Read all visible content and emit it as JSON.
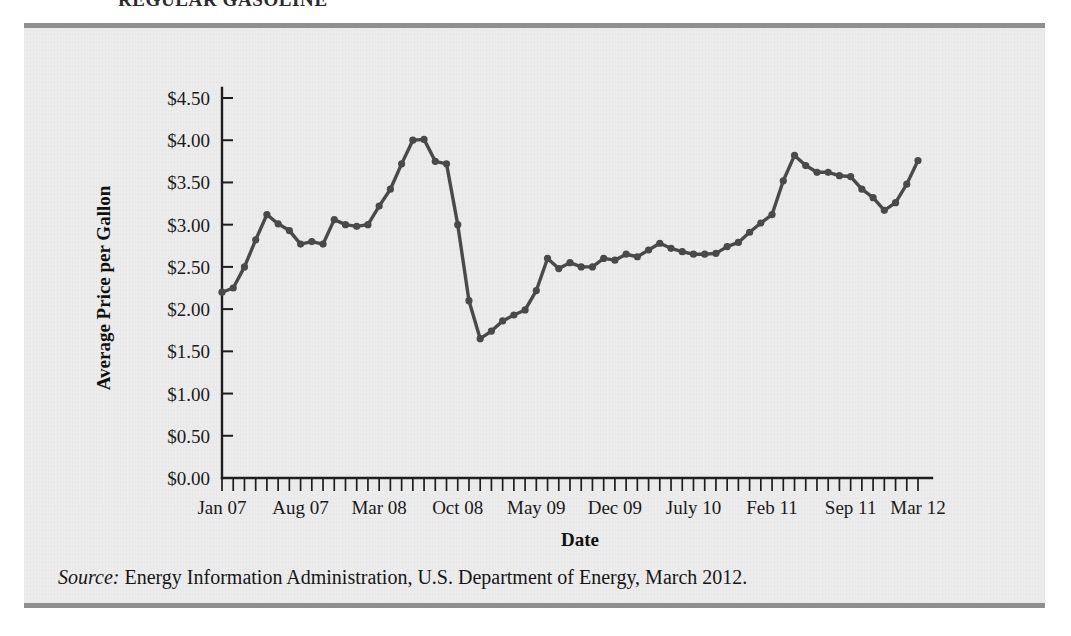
{
  "heading": {
    "text": "REGULAR GASOLINE"
  },
  "caption": {
    "source_label": "Source:",
    "source_text": " Energy Information Administration, U.S. Department of Energy, March 2012."
  },
  "colors": {
    "panel_background": "#ececec",
    "rule": "#8f8f8f",
    "series": "#4a4a4a",
    "axis": "#1e1e1e",
    "text": "#1a1a1a"
  },
  "chart_data": {
    "type": "line",
    "title": "REGULAR GASOLINE",
    "xlabel": "Date",
    "ylabel": "Average Price per Gallon",
    "ylim": [
      0,
      4.5
    ],
    "ytick_step": 0.5,
    "ytick_labels": [
      "$0.00",
      "$0.50",
      "$1.00",
      "$1.50",
      "$2.00",
      "$2.50",
      "$3.00",
      "$3.50",
      "$4.00",
      "$4.50"
    ],
    "ytick_values": [
      0,
      0.5,
      1.0,
      1.5,
      2.0,
      2.5,
      3.0,
      3.5,
      4.0,
      4.5
    ],
    "xtick_labels": [
      "Jan 07",
      "Aug 07",
      "Mar 08",
      "Oct 08",
      "May 09",
      "Dec 09",
      "July 10",
      "Feb 11",
      "Sep 11",
      "Mar 12"
    ],
    "xtick_indices": [
      0,
      7,
      14,
      21,
      28,
      35,
      42,
      49,
      56,
      62
    ],
    "grid": false,
    "legend": "none",
    "markers": true,
    "x": [
      "Jan 07",
      "Feb 07",
      "Mar 07",
      "Apr 07",
      "May 07",
      "Jun 07",
      "Jul 07",
      "Aug 07",
      "Sep 07",
      "Oct 07",
      "Nov 07",
      "Dec 07",
      "Jan 08",
      "Feb 08",
      "Mar 08",
      "Apr 08",
      "May 08",
      "Jun 08",
      "Jul 08",
      "Aug 08",
      "Sep 08",
      "Oct 08",
      "Nov 08",
      "Dec 08",
      "Jan 09",
      "Feb 09",
      "Mar 09",
      "Apr 09",
      "May 09",
      "Jun 09",
      "Jul 09",
      "Aug 09",
      "Sep 09",
      "Oct 09",
      "Nov 09",
      "Dec 09",
      "Jan 10",
      "Feb 10",
      "Mar 10",
      "Apr 10",
      "May 10",
      "Jun 10",
      "July 10",
      "Aug 10",
      "Sep 10",
      "Oct 10",
      "Nov 10",
      "Dec 10",
      "Jan 11",
      "Feb 11",
      "Mar 11",
      "Apr 11",
      "May 11",
      "Jun 11",
      "Jul 11",
      "Aug 11",
      "Sep 11",
      "Oct 11",
      "Nov 11",
      "Dec 11",
      "Jan 12",
      "Feb 12",
      "Mar 12"
    ],
    "values": [
      2.2,
      2.25,
      2.5,
      2.82,
      3.12,
      3.01,
      2.93,
      2.77,
      2.8,
      2.77,
      3.06,
      3.0,
      2.98,
      3.0,
      3.22,
      3.42,
      3.72,
      4.0,
      4.01,
      3.75,
      3.72,
      3.0,
      2.1,
      1.65,
      1.74,
      1.86,
      1.93,
      1.99,
      2.22,
      2.6,
      2.48,
      2.55,
      2.5,
      2.5,
      2.6,
      2.58,
      2.65,
      2.62,
      2.7,
      2.78,
      2.72,
      2.68,
      2.65,
      2.65,
      2.66,
      2.74,
      2.79,
      2.91,
      3.02,
      3.12,
      3.52,
      3.82,
      3.7,
      3.62,
      3.62,
      3.58,
      3.57,
      3.42,
      3.32,
      3.17,
      3.26,
      3.48,
      3.76
    ]
  }
}
